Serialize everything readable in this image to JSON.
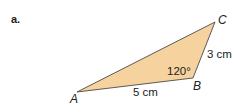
{
  "part_label": "a.",
  "triangle": {
    "fill": "#f6d39e",
    "stroke": "#4a4a4a",
    "vertices": {
      "A": "A",
      "B": "B",
      "C": "C"
    },
    "side_AB": "5 cm",
    "side_BC": "3 cm",
    "angle_B": "120°"
  }
}
